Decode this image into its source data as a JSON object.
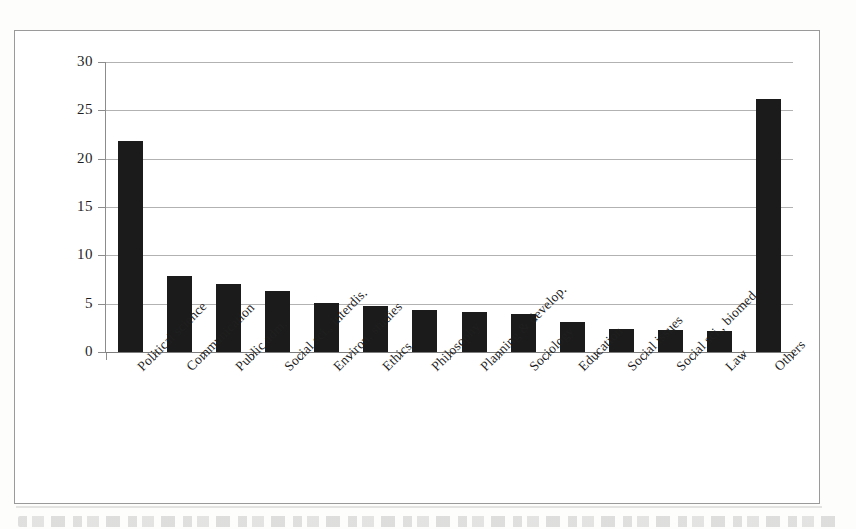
{
  "chart_data": {
    "type": "bar",
    "title": "",
    "subtitle": "",
    "xlabel": "",
    "ylabel": "",
    "ylim": [
      0,
      30
    ],
    "ytick_values": [
      0,
      5,
      10,
      15,
      20,
      25,
      30
    ],
    "ytick_labels": [
      "0",
      "5",
      "10",
      "15",
      "20",
      "25",
      "30"
    ],
    "grid": "horizontal",
    "legend": "none",
    "bar_color": "#1b1b1b",
    "categories": [
      "Political science",
      "Communication",
      "Public adm.",
      "Social sci., interdis.",
      "Environ. studies",
      "Ethics",
      "Philosophy",
      "Planning & develop.",
      "Sociology",
      "Education",
      "Social issues",
      "Social sci., biomed.",
      "Law",
      "Others"
    ],
    "values": [
      21.8,
      7.9,
      7.0,
      6.3,
      5.1,
      4.8,
      4.3,
      4.1,
      3.9,
      3.1,
      2.4,
      2.3,
      2.2,
      26.2
    ]
  },
  "figure": {
    "frame_color": "#9a9a9a",
    "background": "#ffffff",
    "gridline_color": "#b2b2b2",
    "axis_color": "#8c8c8c"
  }
}
